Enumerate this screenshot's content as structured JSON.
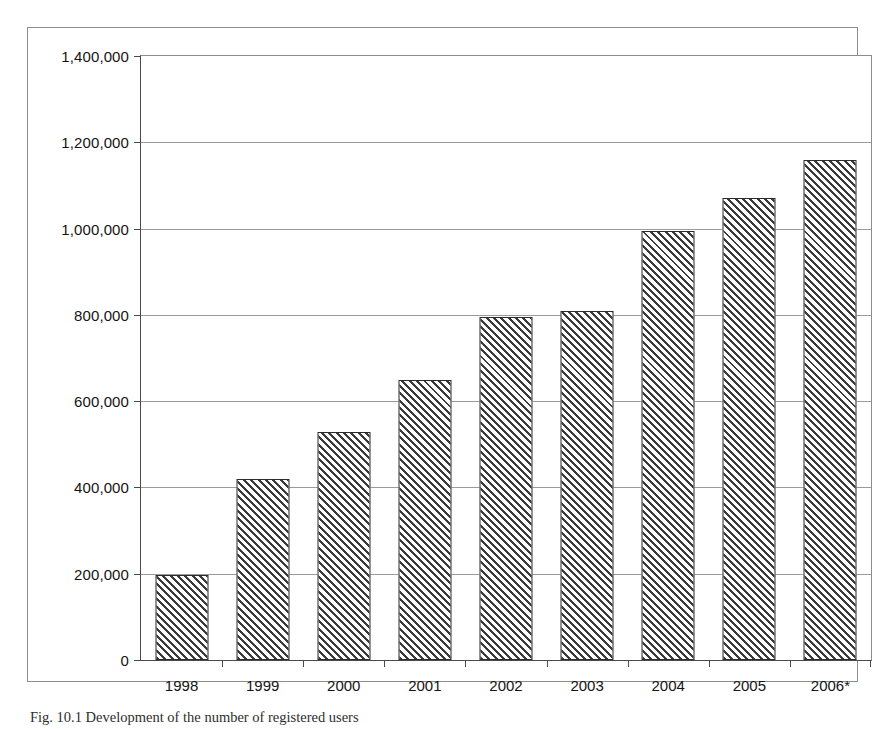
{
  "figure": {
    "caption": "Fig. 10.1 Development of the number of registered users"
  },
  "chart_data": {
    "type": "bar",
    "title": "",
    "xlabel": "",
    "ylabel": "",
    "categories": [
      "1998",
      "1999",
      "2000",
      "2001",
      "2002",
      "2003",
      "2004",
      "2005",
      "2006*"
    ],
    "values": [
      198000,
      420000,
      528000,
      648000,
      795000,
      808000,
      995000,
      1070000,
      1160000
    ],
    "ylim": [
      0,
      1400000
    ],
    "ytick_values": [
      0,
      200000,
      400000,
      600000,
      800000,
      1000000,
      1200000,
      1400000
    ],
    "ytick_labels": [
      "0",
      "200,000",
      "400,000",
      "600,000",
      "800,000",
      "1,000,000",
      "1,200,000",
      "1,400,000"
    ],
    "grid": true,
    "legend": "none",
    "bar_fill": "diagonal-hatch",
    "bar_fill_color": "#3a3a3a",
    "bar_edge_color": "#2b2b2b",
    "gridline_color": "#9a9a9a",
    "axis_color": "#4a4a4a",
    "background_color": "#ffffff"
  }
}
